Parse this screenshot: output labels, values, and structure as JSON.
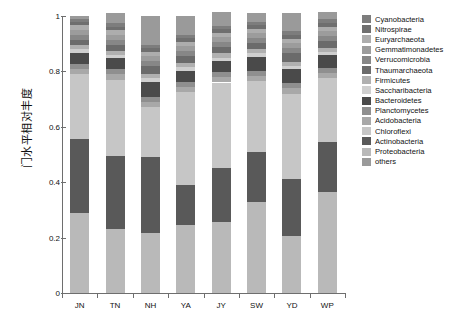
{
  "chart_data": {
    "type": "bar",
    "subtype": "stacked-bar-100-percent",
    "title": "",
    "xlabel": "",
    "ylabel": "门水平相对丰度",
    "ylim": [
      0,
      1
    ],
    "yticks": [
      "0",
      "0.2",
      "0.4",
      "0.6",
      "0.8",
      "1"
    ],
    "ytick_values": [
      0,
      0.2,
      0.4,
      0.6,
      0.8,
      1
    ],
    "grid": false,
    "legend_position": "right",
    "categories": [
      "JN",
      "TN",
      "NH",
      "YA",
      "JY",
      "SW",
      "YD",
      "WP"
    ],
    "series": [
      {
        "name": "Proteobacteria",
        "color": "#b9b9b9",
        "values": [
          0.29,
          0.23,
          0.215,
          0.245,
          0.255,
          0.33,
          0.205,
          0.365
        ]
      },
      {
        "name": "Actinobacteria",
        "color": "#595959",
        "values": [
          0.265,
          0.265,
          0.275,
          0.145,
          0.195,
          0.18,
          0.205,
          0.18
        ]
      },
      {
        "name": "Chloroflexi",
        "color": "#c6c6c6",
        "values": [
          0.235,
          0.275,
          0.18,
          0.335,
          0.31,
          0.255,
          0.31,
          0.23
        ]
      },
      {
        "name": "Acidobacteria",
        "color": "#a8a8a8",
        "values": [
          0.02,
          0.02,
          0.02,
          0.02,
          0.02,
          0.02,
          0.02,
          0.02
        ]
      },
      {
        "name": "Planctomycetes",
        "color": "#8f8f8f",
        "values": [
          0.018,
          0.018,
          0.018,
          0.018,
          0.018,
          0.018,
          0.018,
          0.018
        ]
      },
      {
        "name": "Bacteroidetes",
        "color": "#4a4a4a",
        "values": [
          0.04,
          0.04,
          0.055,
          0.04,
          0.04,
          0.05,
          0.05,
          0.045
        ]
      },
      {
        "name": "Saccharibacteria",
        "color": "#cfcfcf",
        "values": [
          0.012,
          0.012,
          0.012,
          0.012,
          0.012,
          0.012,
          0.012,
          0.012
        ]
      },
      {
        "name": "Firmicutes",
        "color": "#b0b0b0",
        "values": [
          0.015,
          0.015,
          0.015,
          0.015,
          0.015,
          0.015,
          0.015,
          0.015
        ]
      },
      {
        "name": "Thaumarchaeota",
        "color": "#6b6b6b",
        "values": [
          0.02,
          0.022,
          0.028,
          0.025,
          0.022,
          0.022,
          0.03,
          0.025
        ]
      },
      {
        "name": "Verrucomicrobia",
        "color": "#878787",
        "values": [
          0.018,
          0.018,
          0.018,
          0.018,
          0.018,
          0.018,
          0.018,
          0.018
        ]
      },
      {
        "name": "Gemmatimonadetes",
        "color": "#9c9c9c",
        "values": [
          0.018,
          0.018,
          0.018,
          0.018,
          0.018,
          0.018,
          0.018,
          0.018
        ]
      },
      {
        "name": "Euryarchaeota",
        "color": "#adadad",
        "values": [
          0.015,
          0.015,
          0.015,
          0.015,
          0.015,
          0.015,
          0.015,
          0.015
        ]
      },
      {
        "name": "Nitrospirae",
        "color": "#6f6f6f",
        "values": [
          0.014,
          0.014,
          0.014,
          0.014,
          0.014,
          0.014,
          0.014,
          0.014
        ]
      },
      {
        "name": "Cyanobacteria",
        "color": "#7d7d7d",
        "values": [
          0.01,
          0.013,
          0.012,
          0.01,
          0.013,
          0.013,
          0.015,
          0.013
        ]
      },
      {
        "name": "others",
        "color": "#9a9a9a",
        "values": [
          0.01,
          0.035,
          0.105,
          0.07,
          0.05,
          0.03,
          0.065,
          0.025
        ]
      }
    ],
    "legend": [
      {
        "label": "Cyanobacteria",
        "color": "#7d7d7d"
      },
      {
        "label": "Nitrospirae",
        "color": "#6f6f6f"
      },
      {
        "label": "Euryarchaeota",
        "color": "#adadad"
      },
      {
        "label": "Gemmatimonadetes",
        "color": "#9c9c9c"
      },
      {
        "label": "Verrucomicrobia",
        "color": "#878787"
      },
      {
        "label": "Thaumarchaeota",
        "color": "#6b6b6b"
      },
      {
        "label": "Firmicutes",
        "color": "#b0b0b0"
      },
      {
        "label": "Saccharibacteria",
        "color": "#cfcfcf"
      },
      {
        "label": "Bacteroidetes",
        "color": "#4a4a4a"
      },
      {
        "label": "Planctomycetes",
        "color": "#8f8f8f"
      },
      {
        "label": "Acidobacteria",
        "color": "#a8a8a8"
      },
      {
        "label": "Chloroflexi",
        "color": "#c6c6c6"
      },
      {
        "label": "Actinobacteria",
        "color": "#595959"
      },
      {
        "label": "Proteobacteria",
        "color": "#b9b9b9"
      },
      {
        "label": "others",
        "color": "#9a9a9a"
      }
    ]
  }
}
